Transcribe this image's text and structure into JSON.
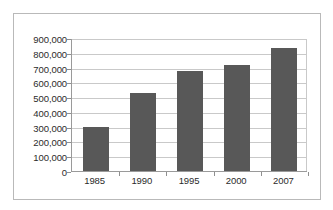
{
  "chart_data": {
    "type": "bar",
    "title": "",
    "subtitle": "",
    "xlabel": "",
    "ylabel": "",
    "categories": [
      "1985",
      "1990",
      "1995",
      "2000",
      "2007"
    ],
    "values": [
      300000,
      530000,
      680000,
      715000,
      830000
    ],
    "series": [
      {
        "name": "",
        "values": [
          300000,
          530000,
          680000,
          715000,
          830000
        ]
      }
    ],
    "ylim": [
      0,
      900000
    ],
    "ytick_values": [
      0,
      100000,
      200000,
      300000,
      400000,
      500000,
      600000,
      700000,
      800000,
      900000
    ],
    "ytick_labels": [
      "900,000",
      "800,000",
      "700,000",
      "600,000",
      "500,000",
      "400,000",
      "300,000",
      "200,000",
      "100,000",
      "0"
    ],
    "grid": true,
    "grid_axis": "y",
    "legend": false,
    "legend_position": "none",
    "annotations": [],
    "colors": {
      "bar": "#585858",
      "gridline": "#c9c9c9",
      "axis": "#9a9a9a",
      "text": "#2b2b2b",
      "frame": "#b9b9b9",
      "background": "#ffffff"
    }
  }
}
